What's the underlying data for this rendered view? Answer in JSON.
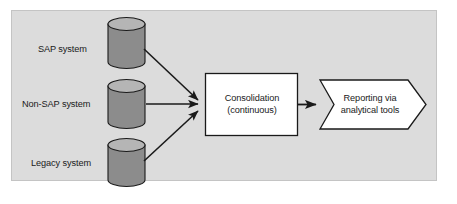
{
  "diagram": {
    "type": "flow-diagram",
    "background_color": "#dcdcdc",
    "panel_border_color": "#c4c4c4",
    "stroke_color": "#1a1a1a",
    "cylinder_body_color": "#8c8c8c",
    "cylinder_top_color": "#b5b5b5",
    "box_fill_color": "#ffffff",
    "sources": [
      {
        "id": "sap",
        "label": "SAP system"
      },
      {
        "id": "nonsap",
        "label": "Non-SAP system"
      },
      {
        "id": "legacy",
        "label": "Legacy system"
      }
    ],
    "process": {
      "id": "consolidation",
      "line1": "Consolidation",
      "line2": "(continuous)"
    },
    "output": {
      "id": "reporting",
      "line1": "Reporting via",
      "line2": "analytical tools"
    },
    "connections": [
      {
        "from": "sap",
        "to": "consolidation",
        "style": "arrow"
      },
      {
        "from": "nonsap",
        "to": "consolidation",
        "style": "arrow"
      },
      {
        "from": "legacy",
        "to": "consolidation",
        "style": "arrow"
      },
      {
        "from": "consolidation",
        "to": "reporting",
        "style": "arrow"
      }
    ]
  }
}
